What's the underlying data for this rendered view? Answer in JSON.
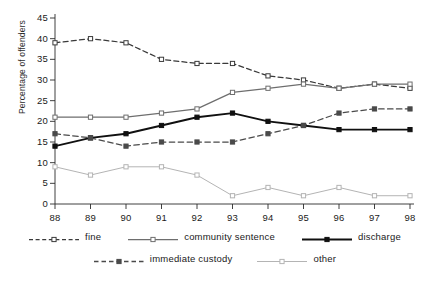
{
  "chart_data": {
    "type": "line",
    "title": "",
    "xlabel": "",
    "ylabel": "Percentage of offenders",
    "categories": [
      "88",
      "89",
      "90",
      "91",
      "92",
      "93",
      "94",
      "95",
      "96",
      "97",
      "98"
    ],
    "x": [
      88,
      89,
      90,
      91,
      92,
      93,
      94,
      95,
      96,
      97,
      98
    ],
    "xlim": [
      88,
      98
    ],
    "ylim": [
      0,
      45
    ],
    "yticks": [
      0,
      5,
      10,
      15,
      20,
      25,
      30,
      35,
      40,
      45
    ],
    "xticks": [
      88,
      89,
      90,
      91,
      92,
      93,
      94,
      95,
      96,
      97,
      98
    ],
    "grid": false,
    "legend_position": "bottom",
    "series": [
      {
        "name": "fine",
        "values": [
          39,
          40,
          39,
          35,
          34,
          34,
          31,
          30,
          28,
          29,
          28
        ],
        "color": "#3a3a3a",
        "line_style": "dashed",
        "marker": "open-square"
      },
      {
        "name": "community sentence",
        "values": [
          21,
          21,
          21,
          22,
          23,
          27,
          28,
          29,
          28,
          29,
          29
        ],
        "color": "#6e6e6e",
        "line_style": "solid",
        "marker": "open-square"
      },
      {
        "name": "discharge",
        "values": [
          14,
          16,
          17,
          19,
          21,
          22,
          20,
          19,
          18,
          18,
          18
        ],
        "color": "#101010",
        "line_style": "solid",
        "marker": "filled-square"
      },
      {
        "name": "immediate custody",
        "values": [
          17,
          16,
          14,
          15,
          15,
          15,
          17,
          19,
          22,
          23,
          23
        ],
        "color": "#4a4a4a",
        "line_style": "dashed",
        "marker": "filled-square"
      },
      {
        "name": "other",
        "values": [
          9,
          7,
          9,
          9,
          7,
          2,
          4,
          2,
          4,
          2,
          2
        ],
        "color": "#b4b4b4",
        "line_style": "solid",
        "marker": "open-square"
      }
    ]
  },
  "axes": {
    "y_title": "Percentage of offenders",
    "y_tick_labels": [
      "45",
      "40",
      "35",
      "30",
      "25",
      "20",
      "15",
      "10",
      "5",
      "0"
    ],
    "x_tick_labels": [
      "88",
      "89",
      "90",
      "91",
      "92",
      "93",
      "94",
      "95",
      "96",
      "97",
      "98"
    ]
  },
  "legend": {
    "row1": [
      {
        "label": "fine",
        "key": "dashed-open-square-key"
      },
      {
        "label": "community sentence",
        "key": "solid-open-square-key"
      },
      {
        "label": "discharge",
        "key": "solid-filled-square-key"
      }
    ],
    "row2": [
      {
        "label": "immediate custody",
        "key": "dashed-filled-square-key"
      },
      {
        "label": "other",
        "key": "light-solid-open-square-key"
      }
    ]
  },
  "colors": {
    "axis": "#2b2b2b",
    "fine": "#3a3a3a",
    "community_sentence": "#6e6e6e",
    "discharge": "#101010",
    "immediate_custody": "#4a4a4a",
    "other": "#b4b4b4",
    "background": "#ffffff"
  }
}
